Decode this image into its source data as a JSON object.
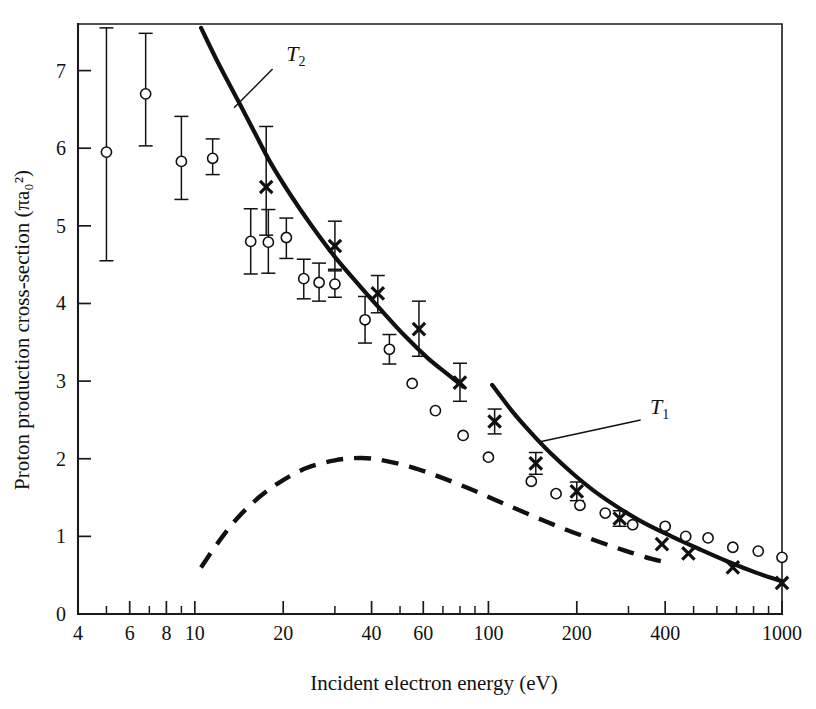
{
  "figure": {
    "title": "",
    "xlabel": "Incident electron energy (eV)",
    "ylabel_plain": "Proton production cross-section",
    "ylabel_units": "(πa₀²)",
    "curve_label_t1": "T",
    "curve_label_t1_sub": "1",
    "curve_label_t2": "T",
    "curve_label_t2_sub": "2",
    "ink_color": "#111111",
    "background_color": "#ffffff"
  },
  "chart_data": {
    "type": "scatter",
    "title": "",
    "xlabel": "Incident electron energy (eV)",
    "ylabel": "Proton production cross-section (πa₀²)",
    "xscale": "log",
    "yscale": "linear",
    "xlim": [
      4,
      1000
    ],
    "ylim": [
      0,
      7.6
    ],
    "grid": false,
    "legend": "none (curves labelled inline)",
    "xticks_major": [
      4,
      6,
      8,
      10,
      20,
      40,
      60,
      100,
      200,
      400,
      1000
    ],
    "xticks_major_labels": [
      "4",
      "6",
      "8",
      "10",
      "20",
      "40",
      "60",
      "100",
      "200",
      "400",
      "1000"
    ],
    "xticks_minor": [
      5,
      7,
      9,
      30,
      50,
      70,
      80,
      90,
      300,
      500,
      600,
      700,
      800,
      900
    ],
    "yticks": [
      0,
      1,
      2,
      3,
      4,
      5,
      6,
      7
    ],
    "yticks_labels": [
      "0",
      "1",
      "2",
      "3",
      "4",
      "5",
      "6",
      "7"
    ],
    "series": [
      {
        "name": "open-circle-measurements",
        "marker": "open circle",
        "points": [
          {
            "x": 5.0,
            "y": 5.95,
            "err_lo": 1.4,
            "err_hi": 1.6
          },
          {
            "x": 6.8,
            "y": 6.7,
            "err_lo": 0.67,
            "err_hi": 0.78
          },
          {
            "x": 9.0,
            "y": 5.83,
            "err_lo": 0.49,
            "err_hi": 0.58
          },
          {
            "x": 11.5,
            "y": 5.87,
            "err_lo": 0.21,
            "err_hi": 0.25
          },
          {
            "x": 15.5,
            "y": 4.8,
            "err_lo": 0.42,
            "err_hi": 0.42
          },
          {
            "x": 17.8,
            "y": 4.79,
            "err_lo": 0.4,
            "err_hi": 0.42
          },
          {
            "x": 20.5,
            "y": 4.85,
            "err_lo": 0.27,
            "err_hi": 0.25
          },
          {
            "x": 23.5,
            "y": 4.32,
            "err_lo": 0.26,
            "err_hi": 0.25
          },
          {
            "x": 26.5,
            "y": 4.27,
            "err_lo": 0.24,
            "err_hi": 0.25
          },
          {
            "x": 30.0,
            "y": 4.25,
            "err_lo": 0.17,
            "err_hi": 0.17
          },
          {
            "x": 38.0,
            "y": 3.79,
            "err_lo": 0.3,
            "err_hi": 0.3
          },
          {
            "x": 46.0,
            "y": 3.41,
            "err_lo": 0.19,
            "err_hi": 0.19
          },
          {
            "x": 55.0,
            "y": 2.97,
            "err_lo": 0.0,
            "err_hi": 0.0
          },
          {
            "x": 66.0,
            "y": 2.62,
            "err_lo": 0.0,
            "err_hi": 0.0
          },
          {
            "x": 82.0,
            "y": 2.3,
            "err_lo": 0.0,
            "err_hi": 0.0
          },
          {
            "x": 100.0,
            "y": 2.02,
            "err_lo": 0.0,
            "err_hi": 0.0
          },
          {
            "x": 140.0,
            "y": 1.71,
            "err_lo": 0.0,
            "err_hi": 0.0
          },
          {
            "x": 170.0,
            "y": 1.55,
            "err_lo": 0.0,
            "err_hi": 0.0
          },
          {
            "x": 205.0,
            "y": 1.4,
            "err_lo": 0.0,
            "err_hi": 0.0
          },
          {
            "x": 250.0,
            "y": 1.3,
            "err_lo": 0.0,
            "err_hi": 0.0
          },
          {
            "x": 310.0,
            "y": 1.15,
            "err_lo": 0.0,
            "err_hi": 0.0
          },
          {
            "x": 400.0,
            "y": 1.13,
            "err_lo": 0.0,
            "err_hi": 0.0
          },
          {
            "x": 470.0,
            "y": 1.0,
            "err_lo": 0.0,
            "err_hi": 0.0
          },
          {
            "x": 560.0,
            "y": 0.98,
            "err_lo": 0.0,
            "err_hi": 0.0
          },
          {
            "x": 680.0,
            "y": 0.86,
            "err_lo": 0.0,
            "err_hi": 0.0
          },
          {
            "x": 830.0,
            "y": 0.81,
            "err_lo": 0.0,
            "err_hi": 0.0
          },
          {
            "x": 1000.0,
            "y": 0.73,
            "err_lo": 0.0,
            "err_hi": 0.0
          }
        ]
      },
      {
        "name": "cross-measurements",
        "marker": "cross",
        "points": [
          {
            "x": 17.5,
            "y": 5.5,
            "err_lo": 0.62,
            "err_hi": 0.78
          },
          {
            "x": 30.0,
            "y": 4.74,
            "err_lo": 0.3,
            "err_hi": 0.32
          },
          {
            "x": 42.0,
            "y": 4.13,
            "err_lo": 0.25,
            "err_hi": 0.23
          },
          {
            "x": 58.0,
            "y": 3.67,
            "err_lo": 0.35,
            "err_hi": 0.36
          },
          {
            "x": 80.0,
            "y": 2.98,
            "err_lo": 0.24,
            "err_hi": 0.25
          },
          {
            "x": 105.0,
            "y": 2.48,
            "err_lo": 0.16,
            "err_hi": 0.16
          },
          {
            "x": 145.0,
            "y": 1.94,
            "err_lo": 0.14,
            "err_hi": 0.14
          },
          {
            "x": 200.0,
            "y": 1.58,
            "err_lo": 0.12,
            "err_hi": 0.12
          },
          {
            "x": 280.0,
            "y": 1.23,
            "err_lo": 0.1,
            "err_hi": 0.1
          },
          {
            "x": 390.0,
            "y": 0.9,
            "err_lo": 0.0,
            "err_hi": 0.0
          },
          {
            "x": 480.0,
            "y": 0.78,
            "err_lo": 0.0,
            "err_hi": 0.0
          },
          {
            "x": 680.0,
            "y": 0.6,
            "err_lo": 0.0,
            "err_hi": 0.0
          },
          {
            "x": 1000.0,
            "y": 0.4,
            "err_lo": 0.0,
            "err_hi": 0.0
          }
        ]
      }
    ],
    "curves": [
      {
        "name": "T2",
        "label": "T₂",
        "style": "solid",
        "points": [
          {
            "x": 10.5,
            "y": 7.55
          },
          {
            "x": 12.0,
            "y": 7.1
          },
          {
            "x": 14.0,
            "y": 6.62
          },
          {
            "x": 16.0,
            "y": 6.2
          },
          {
            "x": 18.0,
            "y": 5.83
          },
          {
            "x": 21.0,
            "y": 5.42
          },
          {
            "x": 25.0,
            "y": 5.0
          },
          {
            "x": 30.0,
            "y": 4.6
          },
          {
            "x": 36.0,
            "y": 4.25
          },
          {
            "x": 43.0,
            "y": 3.92
          },
          {
            "x": 52.0,
            "y": 3.58
          },
          {
            "x": 62.0,
            "y": 3.3
          },
          {
            "x": 72.0,
            "y": 3.1
          },
          {
            "x": 82.0,
            "y": 2.93
          }
        ]
      },
      {
        "name": "T1",
        "label": "T₁",
        "style": "solid",
        "points": [
          {
            "x": 103.0,
            "y": 2.95
          },
          {
            "x": 120.0,
            "y": 2.62
          },
          {
            "x": 140.0,
            "y": 2.33
          },
          {
            "x": 165.0,
            "y": 2.05
          },
          {
            "x": 195.0,
            "y": 1.8
          },
          {
            "x": 230.0,
            "y": 1.58
          },
          {
            "x": 280.0,
            "y": 1.36
          },
          {
            "x": 340.0,
            "y": 1.17
          },
          {
            "x": 420.0,
            "y": 1.0
          },
          {
            "x": 520.0,
            "y": 0.84
          },
          {
            "x": 650.0,
            "y": 0.68
          },
          {
            "x": 820.0,
            "y": 0.53
          },
          {
            "x": 1000.0,
            "y": 0.42
          }
        ]
      },
      {
        "name": "theory-dashed",
        "label": "",
        "style": "dashed",
        "points": [
          {
            "x": 10.5,
            "y": 0.6
          },
          {
            "x": 12.0,
            "y": 0.92
          },
          {
            "x": 14.0,
            "y": 1.24
          },
          {
            "x": 16.5,
            "y": 1.5
          },
          {
            "x": 19.5,
            "y": 1.7
          },
          {
            "x": 24.0,
            "y": 1.88
          },
          {
            "x": 30.0,
            "y": 1.98
          },
          {
            "x": 37.0,
            "y": 2.01
          },
          {
            "x": 45.0,
            "y": 1.97
          },
          {
            "x": 56.0,
            "y": 1.88
          },
          {
            "x": 70.0,
            "y": 1.75
          },
          {
            "x": 88.0,
            "y": 1.6
          },
          {
            "x": 110.0,
            "y": 1.44
          },
          {
            "x": 140.0,
            "y": 1.27
          },
          {
            "x": 180.0,
            "y": 1.1
          },
          {
            "x": 230.0,
            "y": 0.95
          },
          {
            "x": 290.0,
            "y": 0.82
          },
          {
            "x": 360.0,
            "y": 0.71
          },
          {
            "x": 420.0,
            "y": 0.65
          }
        ]
      }
    ],
    "annotations": [
      {
        "text": "T₂",
        "x": 19.5,
        "y": 7.25,
        "note": "label for upper solid curve, leader line to curve"
      },
      {
        "text": "T₁",
        "x": 330.0,
        "y": 2.62,
        "note": "label for lower solid curve, leader line to curve"
      }
    ]
  }
}
